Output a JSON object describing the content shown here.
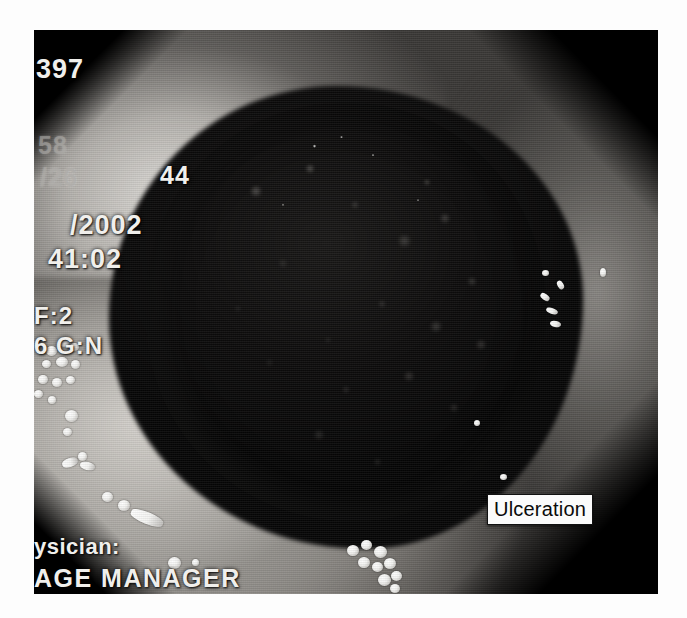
{
  "image": {
    "kind": "endoscopy-photograph",
    "modality": "upper gastrointestinal endoscopy",
    "frame": {
      "left": 34,
      "top": 30,
      "width": 624,
      "height": 564
    }
  },
  "osd": {
    "image_number": "397",
    "counter": "58",
    "partial_id_left": "/26",
    "partial_id_right": "44",
    "date_year": "/2002",
    "time": "41:02",
    "f_stop": "F:2",
    "gain": "6 G:N",
    "physician_label": "ysician:",
    "system_label": "AGE  MANAGER"
  },
  "annotations": [
    {
      "id": "ulceration",
      "label": "Ulceration",
      "x": 487,
      "y": 494,
      "text_color": "#0a0a0a",
      "box_color": "#fbfbfb",
      "border_color": "#111111"
    }
  ],
  "colors": {
    "page_background": "#ffffff",
    "frame_background": "#0a0a0a",
    "mucosa_light": "#d6d3ce",
    "mucosa_mid": "#8a8783",
    "ulcer_dark": "#0d0c0c",
    "bubble_white": "#ffffff",
    "osd_bright": "#f0efec",
    "osd_faint": "#aaa8a4"
  }
}
